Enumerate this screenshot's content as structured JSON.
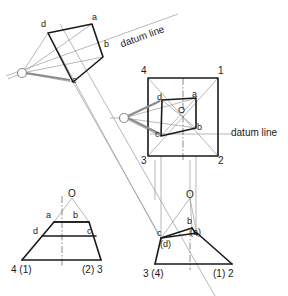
{
  "figure": {
    "background_color": "#ffffff",
    "line_color_solid": "#1a1a1a",
    "line_color_construction": "#8c8c8c",
    "line_color_light": "#b0b0b0"
  },
  "labels": {
    "datum_line_top": "datum line",
    "datum_line_middle": "datum line",
    "plan_rotated": {
      "a": "a",
      "b": "b",
      "c": "c",
      "d": "d"
    },
    "plan_square": {
      "corner_4": "4",
      "corner_1": "1",
      "corner_3": "3",
      "corner_2": "2",
      "a": "a",
      "b": "b",
      "c": "c",
      "d": "d",
      "o": "O"
    },
    "elevation_left": {
      "o": "O",
      "a": "a",
      "b": "b",
      "c": "c",
      "d": "d",
      "base_left": "4 (1)",
      "base_right": "(2) 3"
    },
    "elevation_right": {
      "o": "O",
      "b": "b",
      "a_hidden": "(a)",
      "c": "c",
      "d_hidden": "(d)",
      "base_left": "3 (4)",
      "base_right": "(1) 2"
    }
  },
  "geometry": {
    "plan_rotated_quad": "d(48,33) a(92,24) b(103,57) c(73,82)",
    "plan_square_outer": "4(148,78) 1(218,78) 2(218,156) 3(148,156)",
    "plan_square_inner_quad": "d(162,100) a(196,98) b(196,128) c(161,136)",
    "elevation_left_trapezoid": "apex O(72,198) base 4(1)(22,260) base (2)3(101,260)",
    "elevation_right_trapezoid": "apex O(190,198) base 3(4)(155,264) base (1)2(232,264)"
  }
}
